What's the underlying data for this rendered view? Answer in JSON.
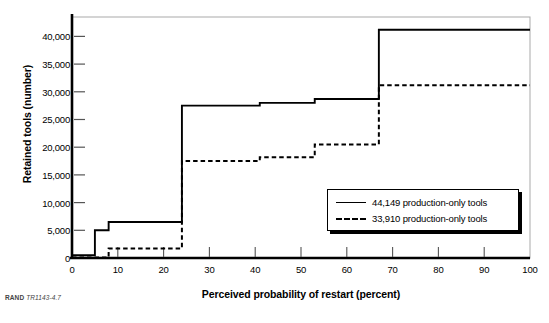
{
  "caption": {
    "source": "RAND",
    "number": "TR1143-4.7"
  },
  "legend": {
    "entries": [
      {
        "label": "44,149 production-only tools",
        "style": "solid"
      },
      {
        "label": "33,910 production-only tools",
        "style": "dashed"
      }
    ]
  },
  "chart_data": {
    "type": "line",
    "subtype": "step",
    "title": "",
    "xlabel": "Perceived probability of restart (percent)",
    "ylabel": "Retained tools (number)",
    "xlim": [
      0,
      100
    ],
    "ylim": [
      0,
      43500
    ],
    "grid": false,
    "legend_position": "bottom-right",
    "xticks": [
      0,
      10,
      20,
      30,
      40,
      50,
      60,
      70,
      80,
      90,
      100
    ],
    "xtick_labels": [
      "0",
      "10",
      "20",
      "30",
      "40",
      "50",
      "60",
      "70",
      "80",
      "90",
      "100"
    ],
    "yticks": [
      0,
      5000,
      10000,
      15000,
      20000,
      25000,
      30000,
      35000,
      40000
    ],
    "ytick_labels": [
      "0",
      "5,000",
      "10,000",
      "15,000",
      "20,000",
      "25,000",
      "30,000",
      "35,000",
      "40,000"
    ],
    "series": [
      {
        "name": "44,149 production-only tools",
        "style": "solid",
        "color": "#000000",
        "steps": [
          {
            "x": 0,
            "y": 500
          },
          {
            "x": 5,
            "y": 5000
          },
          {
            "x": 8,
            "y": 6500
          },
          {
            "x": 24,
            "y": 27500
          },
          {
            "x": 41,
            "y": 28000
          },
          {
            "x": 53,
            "y": 28700
          },
          {
            "x": 67,
            "y": 41200
          },
          {
            "x": 100,
            "y": 41200
          }
        ]
      },
      {
        "name": "33,910 production-only tools",
        "style": "dashed",
        "color": "#000000",
        "steps": [
          {
            "x": 0,
            "y": 100
          },
          {
            "x": 8,
            "y": 1700
          },
          {
            "x": 24,
            "y": 17500
          },
          {
            "x": 41,
            "y": 18200
          },
          {
            "x": 53,
            "y": 20500
          },
          {
            "x": 67,
            "y": 31200
          },
          {
            "x": 100,
            "y": 31200
          }
        ]
      }
    ]
  }
}
